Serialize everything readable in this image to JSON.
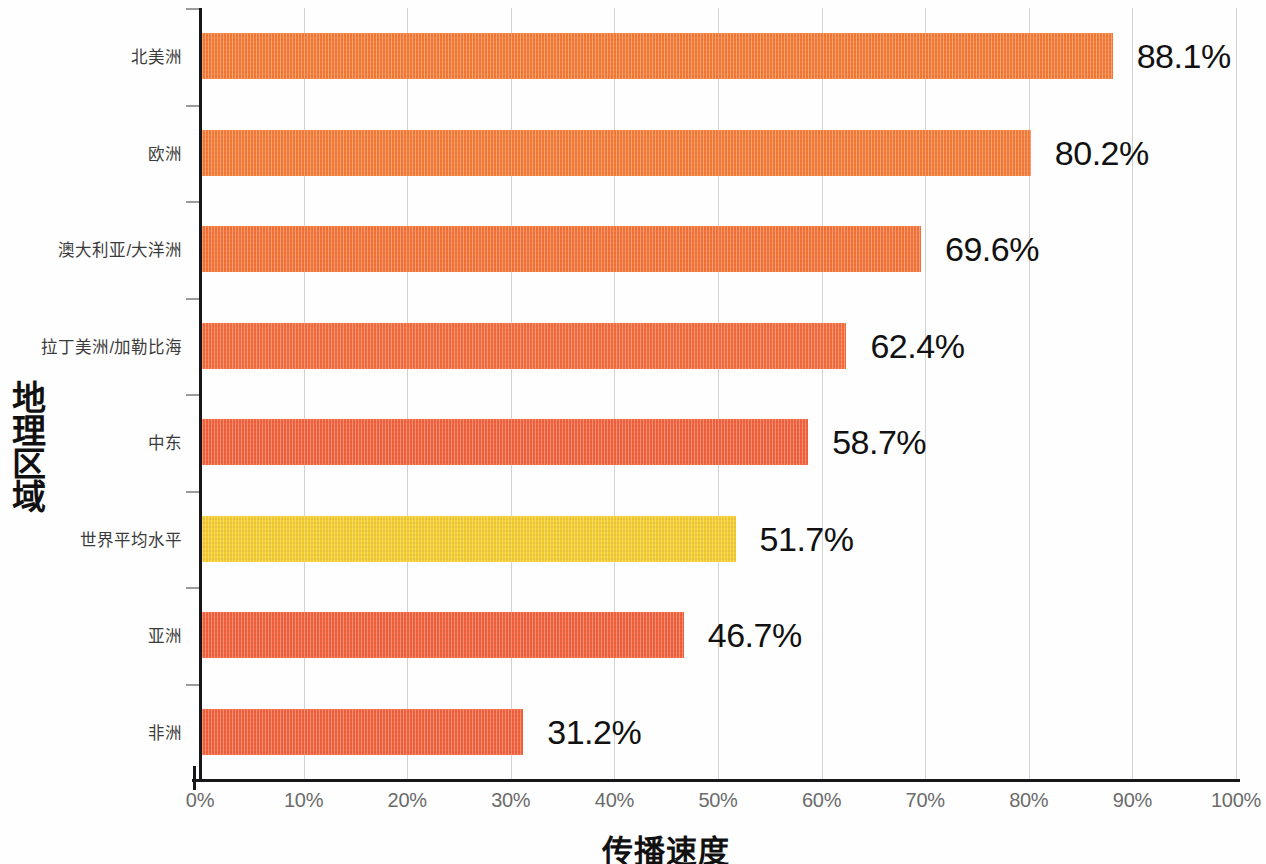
{
  "chart_data": {
    "type": "bar",
    "orientation": "horizontal",
    "title": "",
    "xlabel": "传播速度",
    "ylabel": "地理区域",
    "ylabel_chars": [
      "地",
      "理",
      "区",
      "域"
    ],
    "xlim": [
      0,
      100
    ],
    "grid": true,
    "legend_position": "none",
    "value_suffix": "%",
    "categories": [
      "北美洲",
      "欧洲",
      "澳大利亚/大洋洲",
      "拉丁美洲/加勒比海",
      "中东",
      "世界平均水平",
      "亚洲",
      "非洲"
    ],
    "values": [
      88.1,
      80.2,
      69.6,
      62.4,
      58.7,
      51.7,
      46.7,
      31.2
    ],
    "value_labels": [
      "88.1%",
      "80.2%",
      "69.6%",
      "62.4%",
      "58.7%",
      "51.7%",
      "46.7%",
      "31.2%"
    ],
    "bar_colors": [
      "#F77B37",
      "#F77B37",
      "#F77237",
      "#F66B3C",
      "#F4613C",
      "#F5CC2E",
      "#F4613C",
      "#F4613C"
    ],
    "highlight_index": 5,
    "highlight_color": "#F5CC2E",
    "series_color": "#F4703A",
    "xticks": [
      0,
      10,
      20,
      30,
      40,
      50,
      60,
      70,
      80,
      90,
      100
    ],
    "xtick_labels": [
      "0%",
      "10%",
      "20%",
      "30%",
      "40%",
      "50%",
      "60%",
      "70%",
      "80%",
      "90%",
      "100%"
    ]
  }
}
